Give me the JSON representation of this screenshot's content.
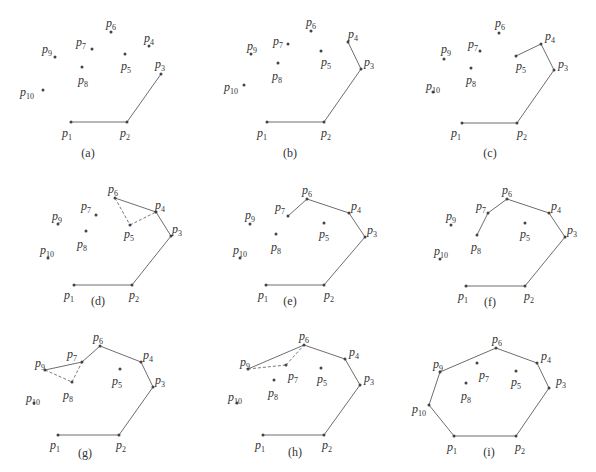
{
  "figure": {
    "colors": {
      "edge": "#6e6e6e",
      "point": "#444444",
      "text": "#333333"
    },
    "panels": [
      {
        "caption": "(a)",
        "cap_pos": [
          88,
          157
        ],
        "points": {
          "1": [
            71,
            122
          ],
          "2": [
            127,
            122
          ],
          "3": [
            161,
            74
          ],
          "4": [
            149,
            46
          ],
          "5": [
            125,
            54
          ],
          "6": [
            111,
            32
          ],
          "7": [
            92,
            49
          ],
          "8": [
            82,
            67
          ],
          "9": [
            55,
            57
          ],
          "10": [
            43,
            90
          ]
        },
        "labels": {
          "1": [
            62,
            137
          ],
          "2": [
            120,
            137
          ],
          "3": [
            155,
            68
          ],
          "4": [
            144,
            42
          ],
          "5": [
            121,
            70
          ],
          "6": [
            106,
            27
          ],
          "7": [
            76,
            46
          ],
          "8": [
            78,
            84
          ],
          "9": [
            42,
            53
          ],
          "10": [
            20,
            96
          ]
        },
        "edges": [
          [
            1,
            2
          ],
          [
            2,
            3
          ]
        ],
        "dashed": []
      },
      {
        "caption": "(b)",
        "cap_pos": [
          290,
          157
        ],
        "points": {
          "1": [
            267,
            122
          ],
          "2": [
            324,
            122
          ],
          "3": [
            361,
            69
          ],
          "4": [
            348,
            42
          ],
          "5": [
            321,
            51
          ],
          "6": [
            311,
            31
          ],
          "7": [
            288,
            44
          ],
          "8": [
            278,
            63
          ],
          "9": [
            251,
            54
          ],
          "10": [
            244,
            85
          ]
        },
        "labels": {
          "1": [
            257,
            137
          ],
          "2": [
            321,
            137
          ],
          "3": [
            364,
            66
          ],
          "4": [
            348,
            38
          ],
          "5": [
            321,
            66
          ],
          "6": [
            306,
            26
          ],
          "7": [
            273,
            45
          ],
          "8": [
            272,
            80
          ],
          "9": [
            247,
            50
          ],
          "10": [
            224,
            91
          ]
        },
        "edges": [
          [
            1,
            2
          ],
          [
            2,
            3
          ],
          [
            3,
            4
          ]
        ],
        "dashed": []
      },
      {
        "caption": "(c)",
        "cap_pos": [
          490,
          157
        ],
        "points": {
          "1": [
            462,
            123
          ],
          "2": [
            517,
            123
          ],
          "3": [
            554,
            70
          ],
          "4": [
            541,
            44
          ],
          "5": [
            516,
            56
          ],
          "6": [
            499,
            33
          ],
          "7": [
            480,
            51
          ],
          "8": [
            471,
            68
          ],
          "9": [
            444,
            59
          ],
          "10": [
            433,
            92
          ]
        },
        "labels": {
          "1": [
            451,
            137
          ],
          "2": [
            517,
            137
          ],
          "3": [
            558,
            68
          ],
          "4": [
            545,
            40
          ],
          "5": [
            516,
            70
          ],
          "6": [
            495,
            27
          ],
          "7": [
            468,
            48
          ],
          "8": [
            466,
            84
          ],
          "9": [
            441,
            53
          ],
          "10": [
            426,
            90
          ]
        },
        "edges": [
          [
            1,
            2
          ],
          [
            2,
            3
          ],
          [
            3,
            4
          ],
          [
            4,
            5
          ]
        ],
        "dashed": []
      },
      {
        "caption": "(d)",
        "cap_pos": [
          98,
          305
        ],
        "points": {
          "1": [
            74,
            285
          ],
          "2": [
            132,
            285
          ],
          "3": [
            171,
            236
          ],
          "4": [
            156,
            212
          ],
          "5": [
            130,
            225
          ],
          "6": [
            115,
            198
          ],
          "7": [
            96,
            215
          ],
          "8": [
            86,
            231
          ],
          "9": [
            58,
            224
          ],
          "10": [
            48,
            258
          ]
        },
        "labels": {
          "1": [
            64,
            299
          ],
          "2": [
            129,
            299
          ],
          "3": [
            172,
            233
          ],
          "4": [
            155,
            209
          ],
          "5": [
            124,
            238
          ],
          "6": [
            108,
            193
          ],
          "7": [
            81,
            210
          ],
          "8": [
            77,
            248
          ],
          "9": [
            52,
            220
          ],
          "10": [
            40,
            254
          ]
        },
        "edges": [
          [
            1,
            2
          ],
          [
            2,
            3
          ],
          [
            3,
            4
          ],
          [
            4,
            6
          ]
        ],
        "dashed": [
          [
            6,
            5
          ],
          [
            5,
            4
          ]
        ]
      },
      {
        "caption": "(e)",
        "cap_pos": [
          290,
          305
        ],
        "points": {
          "1": [
            266,
            285
          ],
          "2": [
            324,
            285
          ],
          "3": [
            365,
            237
          ],
          "4": [
            349,
            213
          ],
          "5": [
            324,
            223
          ],
          "6": [
            307,
            199
          ],
          "7": [
            288,
            216
          ],
          "8": [
            276,
            234
          ],
          "9": [
            250,
            224
          ],
          "10": [
            240,
            258
          ]
        },
        "labels": {
          "1": [
            258,
            299
          ],
          "2": [
            324,
            299
          ],
          "3": [
            367,
            234
          ],
          "4": [
            351,
            210
          ],
          "5": [
            319,
            238
          ],
          "6": [
            302,
            194
          ],
          "7": [
            275,
            211
          ],
          "8": [
            271,
            251
          ],
          "9": [
            245,
            219
          ],
          "10": [
            233,
            254
          ]
        },
        "edges": [
          [
            1,
            2
          ],
          [
            2,
            3
          ],
          [
            3,
            4
          ],
          [
            4,
            6
          ],
          [
            6,
            7
          ]
        ],
        "dashed": []
      },
      {
        "caption": "(f)",
        "cap_pos": [
          490,
          306
        ],
        "points": {
          "1": [
            466,
            286
          ],
          "2": [
            525,
            286
          ],
          "3": [
            565,
            237
          ],
          "4": [
            549,
            213
          ],
          "5": [
            525,
            223
          ],
          "6": [
            507,
            199
          ],
          "7": [
            488,
            213
          ],
          "8": [
            477,
            235
          ],
          "9": [
            451,
            225
          ],
          "10": [
            440,
            259
          ]
        },
        "labels": {
          "1": [
            458,
            300
          ],
          "2": [
            524,
            300
          ],
          "3": [
            567,
            234
          ],
          "4": [
            551,
            210
          ],
          "5": [
            520,
            238
          ],
          "6": [
            502,
            194
          ],
          "7": [
            476,
            210
          ],
          "8": [
            471,
            251
          ],
          "9": [
            446,
            220
          ],
          "10": [
            434,
            255
          ]
        },
        "edges": [
          [
            1,
            2
          ],
          [
            2,
            3
          ],
          [
            3,
            4
          ],
          [
            4,
            6
          ],
          [
            6,
            7
          ],
          [
            7,
            8
          ]
        ],
        "dashed": []
      },
      {
        "caption": "(g)",
        "cap_pos": [
          85,
          457
        ],
        "points": {
          "1": [
            58,
            435
          ],
          "2": [
            119,
            435
          ],
          "3": [
            153,
            387
          ],
          "4": [
            141,
            362
          ],
          "5": [
            120,
            369
          ],
          "6": [
            100,
            346
          ],
          "7": [
            82,
            362
          ],
          "8": [
            72,
            382
          ],
          "9": [
            45,
            370
          ],
          "10": [
            34,
            403
          ]
        },
        "labels": {
          "1": [
            50,
            449
          ],
          "2": [
            116,
            449
          ],
          "3": [
            155,
            384
          ],
          "4": [
            143,
            359
          ],
          "5": [
            112,
            385
          ],
          "6": [
            93,
            341
          ],
          "7": [
            67,
            358
          ],
          "8": [
            63,
            399
          ],
          "9": [
            35,
            367
          ],
          "10": [
            26,
            402
          ]
        },
        "edges": [
          [
            1,
            2
          ],
          [
            2,
            3
          ],
          [
            3,
            4
          ],
          [
            4,
            6
          ],
          [
            6,
            7
          ],
          [
            7,
            9
          ]
        ],
        "dashed": [
          [
            9,
            8
          ],
          [
            8,
            7
          ]
        ]
      },
      {
        "caption": "(h)",
        "cap_pos": [
          295,
          456
        ],
        "points": {
          "1": [
            263,
            435
          ],
          "2": [
            324,
            435
          ],
          "3": [
            360,
            385
          ],
          "4": [
            345,
            359
          ],
          "5": [
            321,
            368
          ],
          "6": [
            304,
            345
          ],
          "7": [
            286,
            365
          ],
          "8": [
            274,
            380
          ],
          "9": [
            248,
            369
          ],
          "10": [
            237,
            403
          ]
        },
        "labels": {
          "1": [
            255,
            449
          ],
          "2": [
            322,
            449
          ],
          "3": [
            364,
            382
          ],
          "4": [
            349,
            356
          ],
          "5": [
            317,
            383
          ],
          "6": [
            299,
            340
          ],
          "7": [
            288,
            380
          ],
          "8": [
            268,
            397
          ],
          "9": [
            240,
            366
          ],
          "10": [
            228,
            401
          ]
        },
        "edges": [
          [
            1,
            2
          ],
          [
            2,
            3
          ],
          [
            3,
            4
          ],
          [
            4,
            6
          ],
          [
            6,
            9
          ]
        ],
        "dashed": [
          [
            9,
            7
          ],
          [
            7,
            6
          ]
        ]
      },
      {
        "caption": "(i)",
        "cap_pos": [
          489,
          456
        ],
        "points": {
          "1": [
            454,
            436
          ],
          "2": [
            516,
            436
          ],
          "3": [
            549,
            388
          ],
          "4": [
            537,
            363
          ],
          "5": [
            516,
            371
          ],
          "6": [
            496,
            348
          ],
          "7": [
            477,
            363
          ],
          "8": [
            466,
            383
          ],
          "9": [
            440,
            372
          ],
          "10": [
            429,
            405
          ]
        },
        "labels": {
          "1": [
            447,
            451
          ],
          "2": [
            515,
            451
          ],
          "3": [
            556,
            385
          ],
          "4": [
            541,
            360
          ],
          "5": [
            511,
            386
          ],
          "6": [
            492,
            343
          ],
          "7": [
            479,
            379
          ],
          "8": [
            461,
            400
          ],
          "9": [
            433,
            368
          ],
          "10": [
            412,
            413
          ]
        },
        "edges": [
          [
            1,
            2
          ],
          [
            2,
            3
          ],
          [
            3,
            4
          ],
          [
            4,
            6
          ],
          [
            6,
            9
          ],
          [
            9,
            10
          ],
          [
            10,
            1
          ]
        ],
        "dashed": []
      }
    ]
  }
}
